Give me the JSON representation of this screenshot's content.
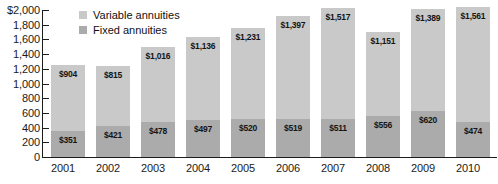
{
  "chart_data": {
    "type": "bar",
    "subtype": "stacked-bar",
    "title": "",
    "xlabel": "",
    "ylabel": "",
    "ylim": [
      0,
      2000
    ],
    "ytick_step": 200,
    "ytick_labels": [
      "$2,000",
      "1,800",
      "1,600",
      "1,400",
      "1,200",
      "1,000",
      "800",
      "600",
      "400",
      "200",
      "0"
    ],
    "ytick_values": [
      2000,
      1800,
      1600,
      1400,
      1200,
      1000,
      800,
      600,
      400,
      200,
      0
    ],
    "grid": false,
    "legend_position": "top-left-inside",
    "categories": [
      "2001",
      "2002",
      "2003",
      "2004",
      "2005",
      "2006",
      "2007",
      "2008",
      "2009",
      "2010"
    ],
    "series": [
      {
        "name": "Variable annuities",
        "color": "#c9c9c9",
        "values": [
          904,
          815,
          1016,
          1136,
          1231,
          1397,
          1517,
          1151,
          1389,
          1561
        ],
        "labels": [
          "$904",
          "$815",
          "$1,016",
          "$1,136",
          "$1,231",
          "$1,397",
          "$1,517",
          "$1,151",
          "$1,389",
          "$1,561"
        ]
      },
      {
        "name": "Fixed annuities",
        "color": "#ababab",
        "values": [
          351,
          421,
          478,
          497,
          520,
          519,
          511,
          556,
          620,
          474
        ],
        "labels": [
          "$351",
          "$421",
          "$478",
          "$497",
          "$520",
          "$519",
          "$511",
          "$556",
          "$620",
          "$474"
        ]
      }
    ]
  },
  "legend": {
    "items": [
      {
        "label": "Variable annuities",
        "swatch": "variable"
      },
      {
        "label": "Fixed annuities",
        "swatch": "fixed"
      }
    ]
  }
}
